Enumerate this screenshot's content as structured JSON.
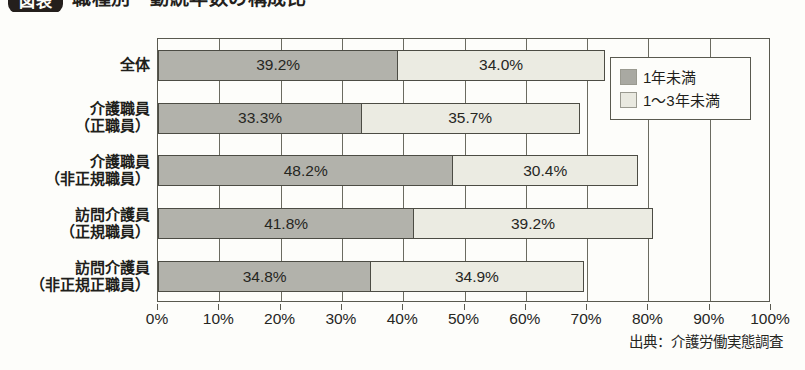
{
  "title": {
    "badge": "図表",
    "text": "職種別・勤続年数の構成比"
  },
  "legend": {
    "items": [
      {
        "label": "1年未満",
        "color": "#a9a9a2"
      },
      {
        "label": "1〜3年未満",
        "color": "#e9e9e0"
      }
    ]
  },
  "source": "出典：介護労働実態調査",
  "chart_data": {
    "type": "bar",
    "orientation": "horizontal",
    "stacked": true,
    "title": "職種別・勤続年数の構成比",
    "xlabel": "",
    "ylabel": "",
    "xlim": [
      0,
      100
    ],
    "grid": true,
    "legend_position": "top-right",
    "tick_labels": [
      "0%",
      "10%",
      "20%",
      "30%",
      "40%",
      "50%",
      "60%",
      "70%",
      "80%",
      "90%",
      "100%"
    ],
    "tick_values": [
      0,
      10,
      20,
      30,
      40,
      50,
      60,
      70,
      80,
      90,
      100
    ],
    "categories": [
      "全体",
      "介護職員\n（正職員）",
      "介護職員\n（非正規職員）",
      "訪問介護員\n（正規職員）",
      "訪問介護員\n（非正規正職員）"
    ],
    "category_lines": [
      [
        "全体"
      ],
      [
        "介護職員",
        "（正職員）"
      ],
      [
        "介護職員",
        "（非正規職員）"
      ],
      [
        "訪問介護員",
        "（正規職員）"
      ],
      [
        "訪問介護員",
        "（非正規正職員）"
      ]
    ],
    "series": [
      {
        "name": "1年未満",
        "color": "#b2b2ab",
        "values": [
          39.2,
          33.3,
          48.2,
          41.8,
          34.8
        ],
        "labels": [
          "39.2%",
          "33.3%",
          "48.2%",
          "41.8%",
          "34.8%"
        ]
      },
      {
        "name": "1〜3年未満",
        "color": "#ebebe2",
        "values": [
          34.0,
          35.7,
          30.4,
          39.2,
          34.9
        ],
        "labels": [
          "34.0%",
          "35.7%",
          "30.4%",
          "39.2%",
          "34.9%"
        ]
      }
    ],
    "totals": [
      73.2,
      69.0,
      78.6,
      81.0,
      69.7
    ]
  }
}
